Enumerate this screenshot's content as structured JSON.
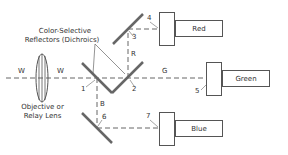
{
  "diagram": {
    "labels": {
      "reflectors": "Color-Selective",
      "reflectors2": "Reflectors (Dichroics)",
      "lens1": "Objective or",
      "lens2": "Relay Lens",
      "w_left": "W",
      "w_right": "W",
      "green_ray": "G",
      "red_ray": "R",
      "blue_ray": "B",
      "n1": "1",
      "n2": "2",
      "n3": "3",
      "n4": "4",
      "n5": "5",
      "n6": "6",
      "n7": "7"
    },
    "channels": [
      {
        "name": "Red"
      },
      {
        "name": "Green"
      },
      {
        "name": "Blue"
      }
    ],
    "colors": {
      "line": "#555555",
      "mirror": "#666666",
      "text": "#333333"
    }
  }
}
